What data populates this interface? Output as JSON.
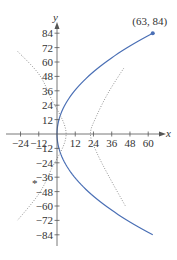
{
  "chart_data": {
    "type": "line",
    "title": "",
    "xlabel": "x",
    "ylabel": "y",
    "xlim": [
      -30,
      66
    ],
    "ylim": [
      -90,
      90
    ],
    "grid": false,
    "legend": null,
    "x_ticks": [
      -24,
      -12,
      12,
      24,
      36,
      48,
      60
    ],
    "x_tick_labels": [
      "−24",
      "−12",
      "12",
      "24",
      "36",
      "48",
      "60"
    ],
    "y_ticks": [
      84,
      72,
      60,
      48,
      36,
      24,
      12,
      -12,
      -24,
      -36,
      -48,
      -60,
      -72,
      -84
    ],
    "y_tick_labels": [
      "84",
      "72",
      "60",
      "48",
      "36",
      "24",
      "12",
      "−12",
      "−24",
      "−36",
      "−48",
      "−60",
      "−72",
      "−84"
    ],
    "series": [
      {
        "name": "parabola x = y^2/112",
        "style": "solid",
        "color": "#4a6fb5",
        "equation": "x = y^2 / 112",
        "y_range": [
          -84,
          84
        ],
        "points": [
          [
            63,
            -84
          ],
          [
            36,
            -63.5
          ],
          [
            16,
            -42.3
          ],
          [
            4,
            -21.2
          ],
          [
            0,
            0
          ],
          [
            4,
            21.2
          ],
          [
            16,
            42.3
          ],
          [
            36,
            63.5
          ],
          [
            63,
            84
          ]
        ]
      },
      {
        "name": "dotted curve left",
        "style": "dotted",
        "color": "#888888",
        "points": [
          [
            -26,
            69
          ],
          [
            -12,
            50
          ],
          [
            -4,
            30
          ],
          [
            6,
            0
          ],
          [
            -4,
            -30
          ],
          [
            -12,
            -50
          ],
          [
            -26,
            -72
          ]
        ]
      },
      {
        "name": "dotted curve right",
        "style": "dotted",
        "color": "#888888",
        "points": [
          [
            44,
            55
          ],
          [
            34,
            35
          ],
          [
            26,
            15
          ],
          [
            22,
            0
          ],
          [
            26,
            -15
          ],
          [
            34,
            -35
          ],
          [
            45,
            -60
          ]
        ]
      }
    ],
    "annotations": [
      {
        "text": "(63, 84)",
        "x": 63,
        "y": 84,
        "marker": "dot"
      }
    ]
  }
}
